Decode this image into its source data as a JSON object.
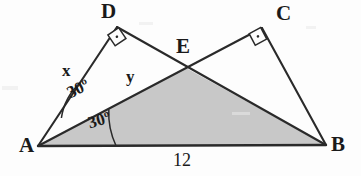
{
  "figure": {
    "background_color": "#fdfdfd",
    "stroke_color": "#2a2a2a",
    "shade_color": "#c8c8c8"
  },
  "vertices": [
    {
      "name": "A",
      "label": "A",
      "x": 38,
      "y": 146
    },
    {
      "name": "B",
      "label": "B",
      "x": 326,
      "y": 145
    },
    {
      "name": "C",
      "label": "C",
      "x": 262,
      "y": 28
    },
    {
      "name": "D",
      "label": "D",
      "x": 117,
      "y": 27
    },
    {
      "name": "E",
      "label": "E",
      "x": 186,
      "y": 68
    }
  ],
  "segments": [
    {
      "name": "A-D",
      "from": "A",
      "to": "D"
    },
    {
      "name": "D-B",
      "from": "D",
      "to": "B"
    },
    {
      "name": "A-C",
      "from": "A",
      "to": "C"
    },
    {
      "name": "C-B",
      "from": "C",
      "to": "B"
    },
    {
      "name": "A-B",
      "from": "A",
      "to": "B"
    }
  ],
  "shaded_region": {
    "name": "triangle-AEB",
    "vertices": [
      "A",
      "E",
      "B"
    ],
    "color": "#c8c8c8"
  },
  "right_angles": [
    {
      "name": "right-angle-at-D",
      "at": "D"
    },
    {
      "name": "right-angle-at-C",
      "at": "C"
    }
  ],
  "angle_marks": [
    {
      "name": "angle-DAE",
      "label": "30º",
      "value": 30,
      "unit": "degrees",
      "at": "A"
    },
    {
      "name": "angle-EAB",
      "label": "30º",
      "value": 30,
      "unit": "degrees",
      "at": "A"
    }
  ],
  "side_labels": [
    {
      "name": "side-x",
      "label": "x",
      "segment": "A-D"
    },
    {
      "name": "side-y",
      "label": "y",
      "segment": "A-E"
    },
    {
      "name": "side-12",
      "label": "12",
      "segment": "A-B"
    }
  ]
}
